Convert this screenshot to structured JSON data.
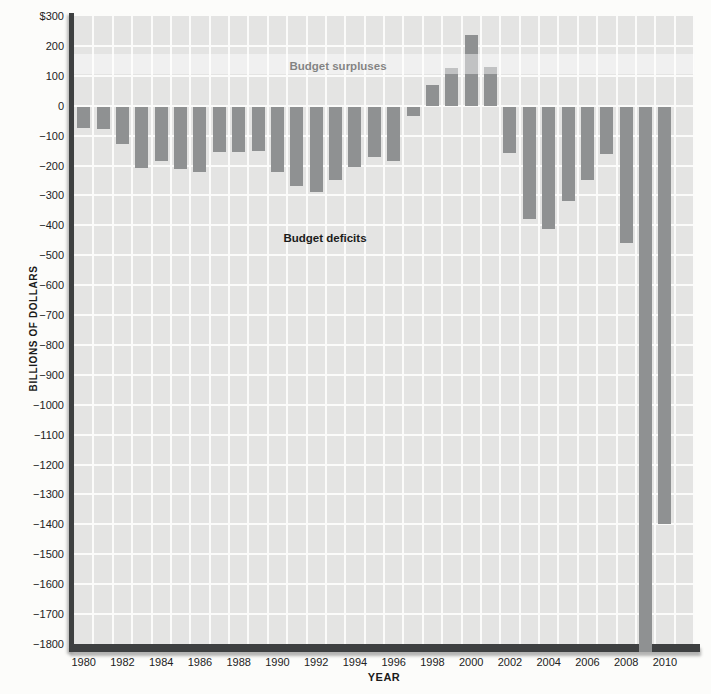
{
  "figure": {
    "page_background": "#fcfcfa",
    "plot_background": "#e4e4e3",
    "gridline_color": "#fbfbfa",
    "bar_color": "#8f9192",
    "axis_color": "#3e4041",
    "text_color": "#1c1c1b"
  },
  "chart_data": {
    "type": "bar",
    "title": "",
    "xlabel": "YEAR",
    "ylabel": "BILLIONS OF DOLLARS",
    "ylim": [
      -1800,
      300
    ],
    "grid": "on",
    "y_axis_unit_prefix_on_top_tick": "$",
    "y_tick_labels": [
      "$300",
      "200",
      "100",
      "0",
      "−100",
      "−200",
      "−300",
      "−400",
      "−500",
      "−600",
      "−700",
      "−800",
      "−900",
      "−1000",
      "−1100",
      "−1200",
      "−1300",
      "−1400",
      "−1500",
      "−1600",
      "−1700",
      "−1800"
    ],
    "y_tick_values": [
      300,
      200,
      100,
      0,
      -100,
      -200,
      -300,
      -400,
      -500,
      -600,
      -700,
      -800,
      -900,
      -1000,
      -1100,
      -1200,
      -1300,
      -1400,
      -1500,
      -1600,
      -1700,
      -1800
    ],
    "x_tick_labels": [
      "1980",
      "1982",
      "1984",
      "1986",
      "1988",
      "1990",
      "1992",
      "1994",
      "1996",
      "1998",
      "2000",
      "2002",
      "2004",
      "2006",
      "2008",
      "2010"
    ],
    "categories": [
      1980,
      1981,
      1982,
      1983,
      1984,
      1985,
      1986,
      1987,
      1988,
      1989,
      1990,
      1991,
      1992,
      1993,
      1994,
      1995,
      1996,
      1997,
      1998,
      1999,
      2000,
      2001,
      2002,
      2003,
      2004,
      2005,
      2006,
      2007,
      2008,
      2009,
      2010
    ],
    "values": [
      -74,
      -79,
      -128,
      -208,
      -185,
      -212,
      -221,
      -155,
      -155,
      -152,
      -221,
      -269,
      -290,
      -250,
      -205,
      -170,
      -185,
      -35,
      69,
      126,
      236,
      128,
      -158,
      -378,
      -413,
      -318,
      -248,
      -161,
      -459,
      -1800,
      -1400
    ],
    "annotations": [
      {
        "text": "Budget surpluses"
      },
      {
        "text": "Budget deficits"
      }
    ]
  }
}
